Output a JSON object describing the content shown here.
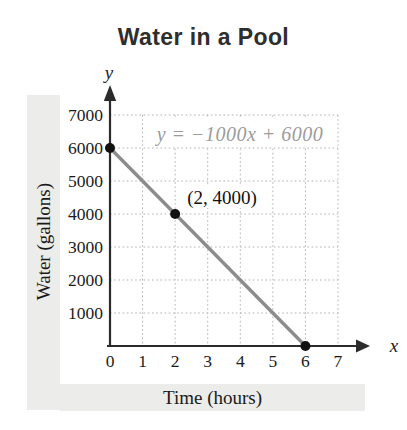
{
  "title": "Water in a Pool",
  "colors": {
    "line": "#8c8c8c",
    "equation_text": "#9b9b9b",
    "axis": "#2b2b2b",
    "grid": "#b3b3b3",
    "text": "#1a1a1a",
    "band": "#ececea",
    "dot": "#111111"
  },
  "chart_data": {
    "type": "line",
    "title": "Water in a Pool",
    "xlabel": "Time (hours)",
    "ylabel": "Water (gallons)",
    "x_axis_letter": "x",
    "y_axis_letter": "y",
    "equation_label": "y = −1000x + 6000",
    "x_ticks": [
      0,
      1,
      2,
      3,
      4,
      5,
      6,
      7
    ],
    "y_ticks": [
      1000,
      2000,
      3000,
      4000,
      5000,
      6000,
      7000
    ],
    "xlim": [
      0,
      7.8
    ],
    "ylim": [
      0,
      7600
    ],
    "grid": "dotted",
    "series": [
      {
        "name": "water-volume-line",
        "points": [
          [
            0,
            6000
          ],
          [
            6,
            0
          ]
        ]
      }
    ],
    "marked_points": [
      [
        0,
        6000
      ],
      [
        2,
        4000
      ],
      [
        6,
        0
      ]
    ],
    "point_label": "(2, 4000)",
    "point_label_point": [
      2,
      4000
    ]
  }
}
